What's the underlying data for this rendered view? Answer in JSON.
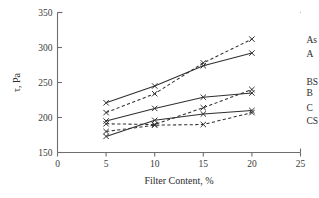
{
  "chart_data": {
    "type": "line",
    "title": "",
    "xlabel": "Filter Content, %",
    "ylabel": "τ, Pa",
    "x": [
      5,
      10,
      15,
      20
    ],
    "xlim": [
      0,
      25
    ],
    "ylim": [
      150,
      350
    ],
    "xticks": [
      "0",
      "5",
      "10",
      "15",
      "20",
      "25"
    ],
    "yticks": [
      "150",
      "200",
      "250",
      "300",
      "350"
    ],
    "xtick_values": [
      0,
      5,
      10,
      15,
      20,
      25
    ],
    "ytick_values": [
      150,
      200,
      250,
      300,
      350
    ],
    "grid": false,
    "legend_position": "right-inline",
    "marker": "x",
    "series": [
      {
        "name": "As",
        "label": "As",
        "linestyle": "dashed",
        "color": "#2f2f2f",
        "values": [
          207,
          234,
          278,
          312
        ]
      },
      {
        "name": "A",
        "label": "A",
        "linestyle": "solid",
        "color": "#2f2f2f",
        "values": [
          221,
          245,
          274,
          292
        ]
      },
      {
        "name": "BS",
        "label": "BS",
        "linestyle": "dashed",
        "color": "#2f2f2f",
        "values": [
          191,
          190,
          214,
          240
        ]
      },
      {
        "name": "B",
        "label": "B",
        "linestyle": "solid",
        "color": "#2f2f2f",
        "values": [
          195,
          213,
          229,
          235
        ]
      },
      {
        "name": "C",
        "label": "C",
        "linestyle": "solid",
        "color": "#2f2f2f",
        "values": [
          173,
          196,
          205,
          210
        ]
      },
      {
        "name": "CS",
        "label": "CS",
        "linestyle": "dashed",
        "color": "#2f2f2f",
        "values": [
          180,
          189,
          190,
          207
        ]
      }
    ],
    "series_label_positions": [
      {
        "name": "As",
        "y": 312
      },
      {
        "name": "A",
        "y": 292
      },
      {
        "name": "BS",
        "y": 252
      },
      {
        "name": "B",
        "y": 235
      },
      {
        "name": "C",
        "y": 214
      },
      {
        "name": "CS",
        "y": 196
      }
    ]
  },
  "figure": {
    "background": "#ffffff",
    "axis_color": "#6e6e6e",
    "line_color": "#2f2f2f"
  }
}
